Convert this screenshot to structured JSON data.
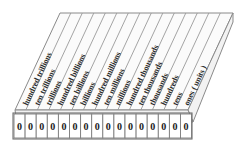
{
  "diagram": {
    "type": "place-value-chart",
    "colors": {
      "background": "#ffffff",
      "top_face": "#fbfbfb",
      "side_face": "#f2f2f2",
      "outline": "#8a8a8a",
      "column_line": "#9a9a9a",
      "cell_border": "#7d7d7d",
      "label_text": "#2b2b2b",
      "digit_text": "#1a1a1a"
    },
    "columns": [
      {
        "index": 0,
        "label": "hundred trillions",
        "digit": "0"
      },
      {
        "index": 1,
        "label": "ten trillions",
        "digit": "0"
      },
      {
        "index": 2,
        "label": "trillions",
        "digit": "0"
      },
      {
        "index": 3,
        "label": "hundred billions",
        "digit": "0"
      },
      {
        "index": 4,
        "label": "ten billions",
        "digit": "0"
      },
      {
        "index": 5,
        "label": "billions",
        "digit": "0"
      },
      {
        "index": 6,
        "label": "hundred millions",
        "digit": "0"
      },
      {
        "index": 7,
        "label": "ten millions",
        "digit": "0"
      },
      {
        "index": 8,
        "label": "millions",
        "digit": "0"
      },
      {
        "index": 9,
        "label": "hundred thousands",
        "digit": "0"
      },
      {
        "index": 10,
        "label": "ten thousands",
        "digit": "0"
      },
      {
        "index": 11,
        "label": "thousands",
        "digit": "0"
      },
      {
        "index": 12,
        "label": "hundreds",
        "digit": "0"
      },
      {
        "index": 13,
        "label": "tens",
        "digit": "0"
      },
      {
        "index": 14,
        "label": "ones ( units )",
        "digit": "0"
      }
    ],
    "extra_cell": {
      "digit": "0"
    },
    "cell_count": 16,
    "label_count": 15
  }
}
